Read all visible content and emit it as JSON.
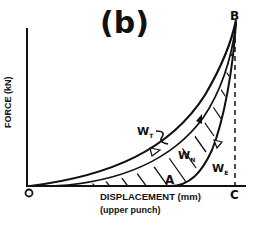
{
  "figure": {
    "panel_label": "(b)",
    "y_axis_label": "FORCE (kN)",
    "x_axis_label": "DISPLACEMENT (mm)",
    "x_axis_sublabel": "(upper punch)",
    "points": {
      "origin": "O",
      "peak": "B",
      "end": "C",
      "lower": "A"
    },
    "work_labels": {
      "total": {
        "base": "W",
        "sub": "T"
      },
      "net": {
        "base": "W",
        "sub": "N"
      },
      "elastic": {
        "base": "W",
        "sub": "E"
      }
    },
    "colors": {
      "ink": "#111111",
      "background": "#ffffff"
    }
  }
}
